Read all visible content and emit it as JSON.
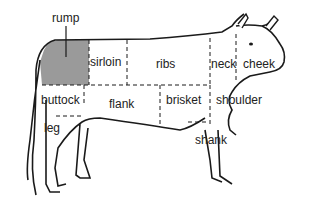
{
  "colors": {
    "outline": "#1a1a1a",
    "rump_fill": "#9a9a9a",
    "background": "#ffffff"
  },
  "cuts": {
    "rump": "rump",
    "sirloin": "sirloin",
    "ribs": "ribs",
    "neck": "neck",
    "cheek": "cheek",
    "buttock": "buttock",
    "flank": "flank",
    "brisket": "brisket",
    "shoulder": "shoulder",
    "leg": "leg",
    "shank": "shank"
  }
}
